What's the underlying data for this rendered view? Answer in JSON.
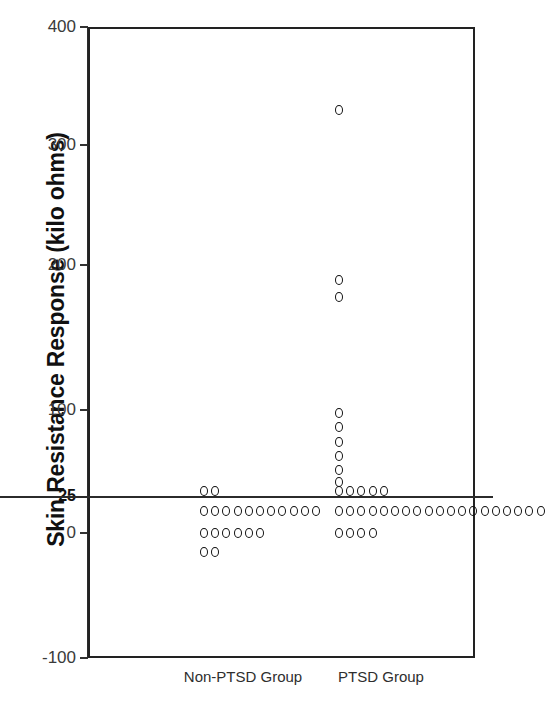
{
  "chart_data": {
    "type": "scatter",
    "title": "",
    "xlabel": "",
    "ylabel": "Skin Resistance Response (kilo ohms)",
    "categories": [
      "Non-PTSD Group",
      "PTSD Group"
    ],
    "ytick_labels": [
      "400",
      "300",
      "200",
      "100",
      "25",
      "0",
      "-100"
    ],
    "ytick_values": [
      400,
      300,
      200,
      100,
      25,
      0,
      -100
    ],
    "ylim": [
      -100,
      400
    ],
    "grid": false,
    "legend": null,
    "reference_line": {
      "value": 25,
      "label": "25",
      "emphasized": true
    },
    "note": "Y axis is drawn with a non-linear break: spacing between 100 and 0 is compressed and the 25 gridline is emphasized.",
    "series": [
      {
        "name": "Non-PTSD Group",
        "x_category": 0,
        "stacked_dot_rows": [
          {
            "value": 30,
            "count": 2
          },
          {
            "value": 15,
            "count": 11
          },
          {
            "value": 0,
            "count": 6
          },
          {
            "value": -15,
            "count": 2
          }
        ],
        "n": 21
      },
      {
        "name": "PTSD Group",
        "x_category": 1,
        "stacked_dot_rows": [
          {
            "value": 330,
            "count": 1
          },
          {
            "value": 190,
            "count": 1
          },
          {
            "value": 178,
            "count": 1
          },
          {
            "value": 97,
            "count": 1
          },
          {
            "value": 85,
            "count": 1
          },
          {
            "value": 72,
            "count": 1
          },
          {
            "value": 60,
            "count": 1
          },
          {
            "value": 48,
            "count": 1
          },
          {
            "value": 38,
            "count": 1
          },
          {
            "value": 30,
            "count": 5
          },
          {
            "value": 15,
            "count": 19
          },
          {
            "value": 0,
            "count": 4
          }
        ],
        "n": 37
      }
    ]
  },
  "axis": {
    "y_title": "Skin Resistance Response (kilo ohms)"
  }
}
